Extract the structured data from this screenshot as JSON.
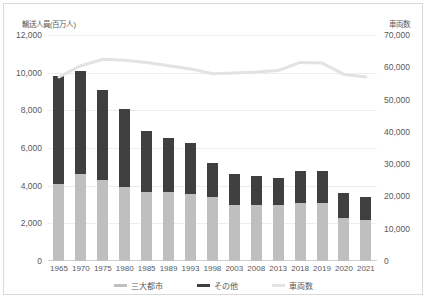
{
  "chart_data": {
    "type": "bar",
    "title": "",
    "subtitle": "",
    "xlabel": "",
    "ylabel": "輸送人員(百万人)",
    "y2label": "車両数",
    "grid": true,
    "legend_position": "bottom",
    "stacked": true,
    "categories": [
      "1965",
      "1970",
      "1975",
      "1980",
      "1985",
      "1989",
      "1993",
      "1998",
      "2003",
      "2008",
      "2013",
      "2018",
      "2019",
      "2020",
      "2021"
    ],
    "ylim": [
      0,
      12000
    ],
    "yticks": [
      "0",
      "2,000",
      "4,000",
      "6,000",
      "8,000",
      "10,000",
      "12,000"
    ],
    "y2lim": [
      0,
      70000
    ],
    "y2ticks": [
      "0",
      "10,000",
      "20,000",
      "30,000",
      "40,000",
      "50,000",
      "60,000",
      "70,000"
    ],
    "series": [
      {
        "name": "三大都市",
        "type": "bar",
        "axis": "left",
        "color": "#bfbfbf",
        "values": [
          4100,
          4600,
          4300,
          3950,
          3650,
          3650,
          3550,
          3400,
          2950,
          2950,
          2950,
          3100,
          3100,
          2300,
          2200
        ]
      },
      {
        "name": "その他",
        "type": "bar",
        "axis": "left",
        "color": "#3f3f3f",
        "values": [
          5700,
          5500,
          4800,
          4100,
          3250,
          2900,
          2700,
          1800,
          1650,
          1550,
          1450,
          1700,
          1700,
          1300,
          1200
        ]
      },
      {
        "name": "車両数",
        "type": "line",
        "axis": "right",
        "color": "#e3e3e3",
        "values": [
          57000,
          60500,
          62500,
          62200,
          61500,
          60500,
          59500,
          58000,
          58200,
          58500,
          59000,
          61500,
          61300,
          57800,
          57000
        ]
      }
    ]
  },
  "legend": [
    {
      "label": "三大都市",
      "color": "#bfbfbf",
      "icon": "legend-swatch-bar"
    },
    {
      "label": "その他",
      "color": "#3f3f3f",
      "icon": "legend-swatch-bar"
    },
    {
      "label": "車両数",
      "color": "#e3e3e3",
      "icon": "legend-swatch-line"
    }
  ]
}
